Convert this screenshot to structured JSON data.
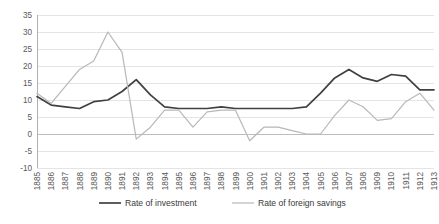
{
  "chart_data": {
    "type": "line",
    "title": "",
    "subtitle": "",
    "xlabel": "",
    "ylabel": "",
    "grid": true,
    "legend_position": "bottom",
    "ylim": [
      -10,
      35
    ],
    "ytick_step": 5,
    "yticks": [
      35,
      30,
      25,
      20,
      15,
      10,
      5,
      0,
      -5,
      -10
    ],
    "ytick_labels": [
      "35",
      "30",
      "25",
      "20",
      "15",
      "10",
      "5",
      "0",
      "-5",
      "-10"
    ],
    "categories": [
      "1885",
      "1886",
      "1887",
      "1888",
      "1889",
      "1890",
      "1891",
      "1892",
      "1893",
      "1894",
      "1895",
      "1896",
      "1897",
      "1898",
      "1899",
      "1900",
      "1901",
      "1902",
      "1903",
      "1904",
      "1905",
      "1906",
      "1907",
      "1908",
      "1909",
      "1910",
      "1911",
      "1912",
      "1913"
    ],
    "series": [
      {
        "name": "Rate of investment",
        "color": "#404040",
        "values": [
          11.0,
          8.5,
          8.0,
          7.5,
          9.5,
          10.0,
          12.5,
          16.0,
          11.5,
          8.0,
          7.5,
          7.5,
          7.5,
          8.0,
          7.5,
          7.5,
          7.5,
          7.5,
          7.5,
          8.0,
          12.0,
          16.5,
          19.0,
          16.5,
          15.5,
          17.5,
          17.0,
          13.0,
          13.0
        ]
      },
      {
        "name": "Rate of foreign savings",
        "color": "#b8b8b8",
        "values": [
          12.0,
          9.0,
          14.0,
          19.0,
          21.5,
          30.0,
          24.0,
          -1.5,
          2.0,
          7.0,
          7.0,
          2.0,
          6.5,
          7.0,
          7.0,
          -2.0,
          2.0,
          2.0,
          1.0,
          0.0,
          0.0,
          5.5,
          10.0,
          8.0,
          4.0,
          4.5,
          9.5,
          12.0,
          7.0
        ]
      }
    ]
  },
  "legend": {
    "items": [
      {
        "label": "Rate of investment",
        "color": "#404040"
      },
      {
        "label": "Rate of foreign savings",
        "color": "#b8b8b8"
      }
    ]
  }
}
